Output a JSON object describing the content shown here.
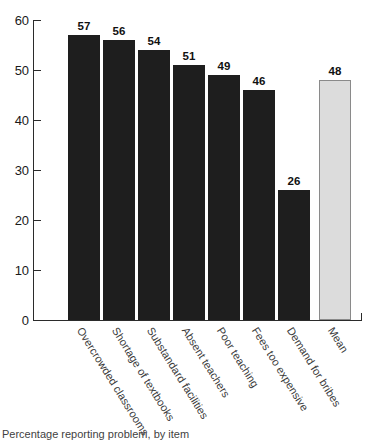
{
  "chart_data": {
    "type": "bar",
    "title": "",
    "subtitle": "",
    "xlabel": "",
    "ylabel": "",
    "ylim": [
      0,
      60
    ],
    "yticks": [
      0,
      10,
      20,
      30,
      40,
      50,
      60
    ],
    "ytick_labels": [
      "0",
      "10",
      "20",
      "30",
      "40",
      "50",
      "60"
    ],
    "grid": false,
    "legend": "none",
    "categories": [
      "Overcrowded classrooms",
      "Shortage of textbooks",
      "Substandard facilities",
      "Absent teachers",
      "Poor teaching",
      "Fees too expensive",
      "Demand for bribes",
      "Mean"
    ],
    "values": [
      57,
      56,
      54,
      51,
      49,
      46,
      26,
      48
    ],
    "value_labels": [
      "57",
      "56",
      "54",
      "51",
      "49",
      "46",
      "26",
      "48"
    ],
    "bar_colors": [
      "#1e1e1e",
      "#1e1e1e",
      "#1e1e1e",
      "#1e1e1e",
      "#1e1e1e",
      "#1e1e1e",
      "#1e1e1e",
      "#dcdcdc"
    ],
    "series": [
      {
        "name": "Percentage of respondents",
        "values": [
          57,
          56,
          54,
          51,
          49,
          46,
          26,
          48
        ]
      }
    ]
  },
  "caption": {
    "text": "Percentage reporting problem, by item"
  },
  "axes": {
    "y_axis_name": "y-axis",
    "x_axis_name": "x-axis"
  }
}
